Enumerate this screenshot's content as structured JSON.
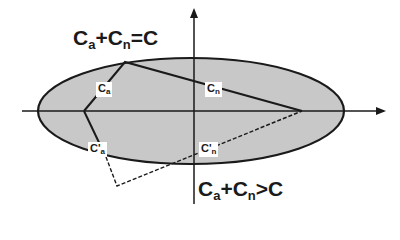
{
  "diagram": {
    "equation_top": {
      "c1": "C",
      "s1": "a",
      "op": "+",
      "c2": "C",
      "s2": "n",
      "rel": "=",
      "rhs": "C"
    },
    "equation_bottom": {
      "c1": "C",
      "s1": "a",
      "op": "+",
      "c2": "C",
      "s2": "n",
      "rel": ">",
      "rhs": "C"
    },
    "labels": {
      "ca": {
        "base": "C",
        "sub": "a"
      },
      "cn": {
        "base": "C",
        "sub": "n"
      },
      "ca_prime": {
        "base": "C'",
        "sub": "a"
      },
      "cn_prime": {
        "base": "C'",
        "sub": "n"
      }
    },
    "colors": {
      "ellipse_fill": "#c8c8c8",
      "stroke": "#1a1a1a",
      "background": "#ffffff"
    }
  }
}
